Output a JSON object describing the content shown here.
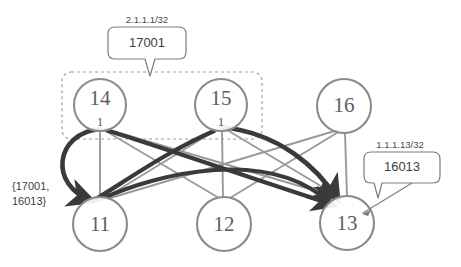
{
  "diagram": {
    "colors": {
      "node_stroke": "#8a8a8a",
      "node_fill": "#ffffff",
      "node_text": "#5e5e5e",
      "edge_light": "#9a9a9a",
      "edge_dark": "#3a3a3a",
      "dashed_group": "#9a9a9a",
      "callout_stroke": "#7d7d7d",
      "background": "#ffffff"
    },
    "nodes": [
      {
        "id": "14",
        "label": "14",
        "sub": "1",
        "cx": 100,
        "cy": 105,
        "r": 26,
        "row": "top"
      },
      {
        "id": "15",
        "label": "15",
        "sub": "1",
        "cx": 221,
        "cy": 105,
        "r": 26,
        "row": "top"
      },
      {
        "id": "16",
        "label": "16",
        "sub": "",
        "cx": 344,
        "cy": 106,
        "r": 27,
        "row": "top"
      },
      {
        "id": "11",
        "label": "11",
        "sub": "",
        "cx": 100,
        "cy": 224,
        "r": 27,
        "row": "bottom"
      },
      {
        "id": "12",
        "label": "12",
        "sub": "",
        "cx": 224,
        "cy": 224,
        "r": 27,
        "row": "bottom"
      },
      {
        "id": "13",
        "label": "13",
        "sub": "",
        "cx": 347,
        "cy": 223,
        "r": 27,
        "row": "bottom"
      }
    ],
    "mesh_edges": [
      {
        "from": "14",
        "to": "11"
      },
      {
        "from": "14",
        "to": "12"
      },
      {
        "from": "14",
        "to": "13"
      },
      {
        "from": "15",
        "to": "11"
      },
      {
        "from": "15",
        "to": "12"
      },
      {
        "from": "15",
        "to": "13"
      },
      {
        "from": "16",
        "to": "11"
      },
      {
        "from": "16",
        "to": "12"
      },
      {
        "from": "16",
        "to": "13"
      }
    ],
    "highlighted_paths": [
      {
        "from": "14",
        "to": "11",
        "style": "curve-left",
        "arrow": true
      },
      {
        "from": "14",
        "to": "13",
        "style": "straight",
        "arrow": true
      },
      {
        "from": "15",
        "to": "13",
        "style": "curve-over",
        "arrow": true
      },
      {
        "from": "11",
        "to": "13",
        "style": "straight",
        "arrow": true
      },
      {
        "from": "15",
        "to": "11",
        "style": "straight",
        "arrow": false
      }
    ],
    "group_box": {
      "label": "",
      "x": 62,
      "y": 72,
      "width": 200,
      "height": 67,
      "style": "dashed-rounded",
      "members": [
        "14",
        "15"
      ]
    },
    "callouts": [
      {
        "id": "callout-17001",
        "prefix": "2.1.1.1/32",
        "value": "17001",
        "box": {
          "x": 108,
          "y": 27,
          "width": 78,
          "height": 32
        },
        "points_to": "group-box"
      },
      {
        "id": "callout-16013",
        "prefix": "1.1.1.13/32",
        "value": "16013",
        "box": {
          "x": 364,
          "y": 152,
          "width": 76,
          "height": 31
        },
        "points_to": "13"
      }
    ],
    "annotations": [
      {
        "id": "set-label",
        "lines": [
          "{17001,",
          "16013}"
        ],
        "x": 12,
        "y": 186,
        "points_to": "11"
      }
    ]
  }
}
